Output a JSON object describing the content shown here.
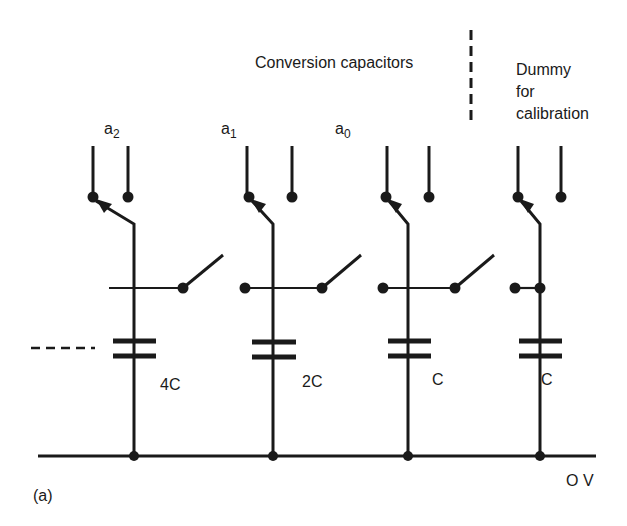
{
  "header": {
    "conversion_label": "Conversion capacitors",
    "dummy_label_lines": [
      "Dummy",
      "for",
      "calibration"
    ]
  },
  "columns": [
    {
      "bit_label": "a",
      "bit_sub": "2",
      "cap_label": "4C"
    },
    {
      "bit_label": "a",
      "bit_sub": "1",
      "cap_label": "2C"
    },
    {
      "bit_label": "a",
      "bit_sub": "0",
      "cap_label": "C"
    },
    {
      "bit_label": "",
      "bit_sub": "",
      "cap_label": "C"
    }
  ],
  "rail": {
    "label": "O V"
  },
  "figure": {
    "label": "(a)"
  },
  "colors": {
    "ink": "#1a1a1a",
    "background": "#ffffff"
  }
}
